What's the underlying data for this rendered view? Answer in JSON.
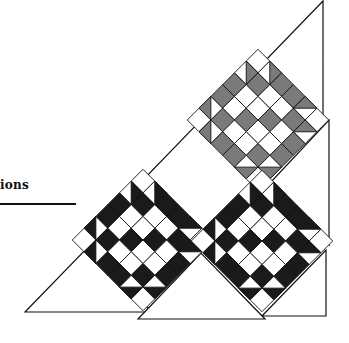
{
  "heading": {
    "text": "ions"
  },
  "diagram": {
    "blocks": [
      {
        "name": "gray-star-block",
        "cx": 258,
        "cy": 120,
        "fill": "#7a7a7a"
      },
      {
        "name": "black-star-block-left",
        "cx": 143,
        "cy": 240,
        "fill": "#1a1a1a"
      },
      {
        "name": "black-star-block-right",
        "cx": 262,
        "cy": 241,
        "fill": "#1a1a1a"
      }
    ],
    "colors": {
      "stroke": "#111111",
      "background": "#ffffff",
      "gray": "#7a7a7a",
      "black": "#1a1a1a"
    }
  }
}
